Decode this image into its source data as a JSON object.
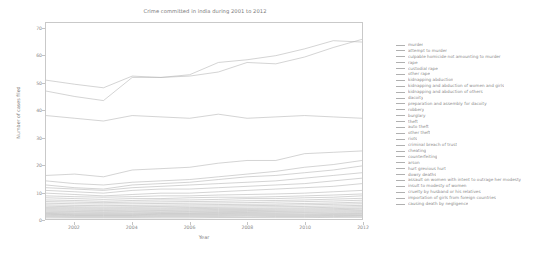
{
  "chart_data": {
    "type": "line",
    "title": "Crime committed in india during 2001 to 2012",
    "xlabel": "Year",
    "ylabel": "Number of cases filed",
    "xlim": [
      2001,
      2012
    ],
    "ylim": [
      0,
      72
    ],
    "grid": false,
    "legend_position": "right",
    "x": [
      2001,
      2002,
      2003,
      2004,
      2005,
      2006,
      2007,
      2008,
      2009,
      2010,
      2011,
      2012
    ],
    "yticks": [
      0,
      10,
      20,
      30,
      40,
      50,
      60,
      70
    ],
    "xticks": [
      2002,
      2004,
      2006,
      2008,
      2010,
      2012
    ],
    "series": [
      {
        "name": "murder",
        "values": [
          51.0,
          49.5,
          48.2,
          52.5,
          52.0,
          52.5,
          54.0,
          57.5,
          57.0,
          59.5,
          63.0,
          66.0
        ]
      },
      {
        "name": "attempt to murder",
        "values": [
          47.0,
          45.0,
          43.5,
          52.0,
          52.0,
          53.0,
          57.5,
          58.5,
          60.0,
          62.5,
          65.5,
          65.0
        ]
      },
      {
        "name": "culpable homicide not amounting to murder",
        "values": [
          38.0,
          37.0,
          36.0,
          38.0,
          37.5,
          37.0,
          38.5,
          37.0,
          37.5,
          38.0,
          37.5,
          37.0
        ]
      },
      {
        "name": "rape",
        "values": [
          16.0,
          16.5,
          15.5,
          18.0,
          18.5,
          19.0,
          20.5,
          21.5,
          21.5,
          24.0,
          24.5,
          25.0
        ]
      },
      {
        "name": "custodial rape",
        "values": [
          14.0,
          13.0,
          12.5,
          13.5,
          14.0,
          14.5,
          15.5,
          16.5,
          17.5,
          19.0,
          20.0,
          21.5
        ]
      },
      {
        "name": "other rape",
        "values": [
          12.5,
          11.5,
          11.0,
          12.5,
          13.0,
          13.5,
          14.5,
          15.5,
          16.0,
          17.0,
          18.0,
          19.5
        ]
      },
      {
        "name": "kidnapping abduction",
        "values": [
          11.5,
          11.0,
          10.5,
          11.5,
          12.0,
          12.5,
          13.0,
          13.5,
          14.0,
          15.0,
          16.0,
          17.0
        ]
      },
      {
        "name": "kidnapping and abduction of women and girls",
        "values": [
          10.5,
          10.0,
          9.5,
          10.5,
          11.0,
          11.0,
          11.5,
          12.0,
          12.5,
          13.0,
          14.0,
          15.0
        ]
      },
      {
        "name": "kidnapping and abduction of others",
        "values": [
          9.5,
          9.0,
          8.5,
          9.0,
          9.5,
          9.5,
          10.0,
          10.5,
          11.0,
          11.5,
          12.0,
          13.0
        ]
      },
      {
        "name": "dacoity",
        "values": [
          8.5,
          8.2,
          8.0,
          8.2,
          8.5,
          8.5,
          8.8,
          9.0,
          9.2,
          9.5,
          10.0,
          10.5
        ]
      },
      {
        "name": "preparation and assembly for dacoity",
        "values": [
          7.8,
          7.5,
          7.2,
          7.5,
          7.5,
          7.8,
          8.0,
          8.0,
          8.2,
          8.5,
          8.8,
          9.2
        ]
      },
      {
        "name": "robbery",
        "values": [
          7.0,
          6.8,
          6.5,
          6.8,
          7.0,
          7.0,
          7.2,
          7.5,
          7.5,
          7.8,
          8.0,
          8.5
        ]
      },
      {
        "name": "burglary",
        "values": [
          6.4,
          6.2,
          6.0,
          6.2,
          6.3,
          6.4,
          6.5,
          6.7,
          6.8,
          7.0,
          7.3,
          7.6
        ]
      },
      {
        "name": "theft",
        "values": [
          5.8,
          5.6,
          5.5,
          5.6,
          5.7,
          5.8,
          5.9,
          6.0,
          6.2,
          6.4,
          6.6,
          6.9
        ]
      },
      {
        "name": "auto theft",
        "values": [
          5.2,
          5.0,
          4.9,
          5.0,
          5.1,
          5.2,
          5.3,
          5.4,
          5.5,
          5.7,
          5.9,
          6.2
        ]
      },
      {
        "name": "other theft",
        "values": [
          4.7,
          4.5,
          4.4,
          4.5,
          4.6,
          4.7,
          4.8,
          4.9,
          5.0,
          5.2,
          5.4,
          5.6
        ]
      },
      {
        "name": "riots",
        "values": [
          4.2,
          4.1,
          4.0,
          4.1,
          4.1,
          4.2,
          4.3,
          4.4,
          4.5,
          4.6,
          4.8,
          5.0
        ]
      },
      {
        "name": "criminal breach of trust",
        "values": [
          3.8,
          3.7,
          3.6,
          3.7,
          3.7,
          3.8,
          3.9,
          3.9,
          4.0,
          4.1,
          4.3,
          4.5
        ]
      },
      {
        "name": "cheating",
        "values": [
          3.4,
          3.3,
          3.2,
          3.3,
          3.3,
          3.4,
          3.5,
          3.5,
          3.6,
          3.7,
          3.8,
          4.0
        ]
      },
      {
        "name": "counterfeiting",
        "values": [
          3.0,
          2.9,
          2.9,
          2.9,
          3.0,
          3.0,
          3.1,
          3.1,
          3.2,
          3.3,
          3.4,
          3.6
        ]
      },
      {
        "name": "arson",
        "values": [
          2.6,
          2.6,
          2.5,
          2.6,
          2.6,
          2.7,
          2.7,
          2.8,
          2.8,
          2.9,
          3.0,
          3.1
        ]
      },
      {
        "name": "hurt grevious hurt",
        "values": [
          2.3,
          2.2,
          2.2,
          2.2,
          2.3,
          2.3,
          2.4,
          2.4,
          2.5,
          2.5,
          2.6,
          2.7
        ]
      },
      {
        "name": "dowry deaths",
        "values": [
          2.0,
          1.9,
          1.9,
          1.9,
          2.0,
          2.0,
          2.0,
          2.1,
          2.1,
          2.2,
          2.2,
          2.3
        ]
      },
      {
        "name": "assault on women with intent to outrage her modesty",
        "values": [
          1.7,
          1.6,
          1.6,
          1.6,
          1.7,
          1.7,
          1.7,
          1.8,
          1.8,
          1.8,
          1.9,
          2.0
        ]
      },
      {
        "name": "insult to modesty of women",
        "values": [
          1.4,
          1.3,
          1.3,
          1.3,
          1.4,
          1.4,
          1.4,
          1.5,
          1.5,
          1.5,
          1.6,
          1.6
        ]
      },
      {
        "name": "cruelty by husband or his relatives",
        "values": [
          1.1,
          1.0,
          1.0,
          1.0,
          1.1,
          1.1,
          1.1,
          1.2,
          1.2,
          1.2,
          1.3,
          1.3
        ]
      },
      {
        "name": "importation of girls from foreign countries",
        "values": [
          0.8,
          0.7,
          0.7,
          0.7,
          0.8,
          0.8,
          0.8,
          0.8,
          0.9,
          0.9,
          0.9,
          1.0
        ]
      },
      {
        "name": "causing death by negligence",
        "values": [
          0.4,
          0.4,
          0.4,
          0.4,
          0.4,
          0.4,
          0.5,
          0.5,
          0.5,
          0.5,
          0.6,
          0.6
        ]
      }
    ]
  },
  "style": {
    "line_color": "#b0b0b0",
    "axis_color": "#c9c9c9",
    "text_color": "#8a8a8a"
  }
}
